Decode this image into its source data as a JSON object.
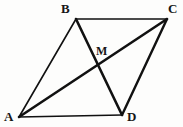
{
  "figure": {
    "kind": "geometry-diagram",
    "background_color": "#fdfdfc",
    "stroke_color": "#111111",
    "label_color": "#161616",
    "canvas": {
      "width": 183,
      "height": 127
    },
    "points": [
      {
        "id": "A",
        "label": "A",
        "x": 19,
        "y": 117
      },
      {
        "id": "B",
        "label": "B",
        "x": 76,
        "y": 19
      },
      {
        "id": "C",
        "label": "C",
        "x": 167,
        "y": 19
      },
      {
        "id": "D",
        "label": "D",
        "x": 122,
        "y": 115
      },
      {
        "id": "M",
        "label": "M",
        "x": 96,
        "y": 68
      }
    ],
    "segments": [
      {
        "id": "AB",
        "from": "A",
        "to": "B",
        "width": 1.6,
        "role": "side"
      },
      {
        "id": "BC",
        "from": "B",
        "to": "C",
        "width": 1.6,
        "role": "side"
      },
      {
        "id": "CD",
        "from": "C",
        "to": "D",
        "width": 2.4,
        "role": "side"
      },
      {
        "id": "AD",
        "from": "A",
        "to": "D",
        "width": 1.6,
        "role": "side"
      },
      {
        "id": "AC",
        "from": "A",
        "to": "C",
        "width": 2.6,
        "role": "diagonal"
      },
      {
        "id": "BD",
        "from": "B",
        "to": "D",
        "width": 2.6,
        "role": "diagonal"
      }
    ],
    "labels": {
      "A": "A",
      "B": "B",
      "C": "C",
      "D": "D",
      "M": "M"
    }
  }
}
